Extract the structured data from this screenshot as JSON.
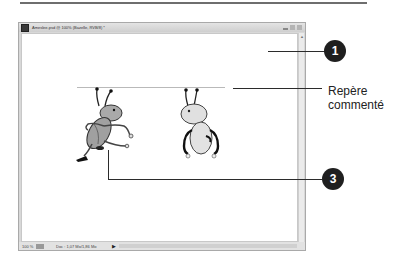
{
  "page": {
    "top_rule": true
  },
  "window": {
    "title": "Ameslee.psd @ 100% (Bazelle, RVB/8) *",
    "controls": [
      "minimize",
      "maximize",
      "close"
    ],
    "status": {
      "zoom": "100 %",
      "info": "Doc : 1,07 Mo/1,86 Mo",
      "arrow": "▶"
    },
    "scroll_arrow": "▲"
  },
  "canvas": {
    "characters": [
      {
        "name": "ant-running",
        "fill": "#a9a9a9"
      },
      {
        "name": "ant-standing",
        "fill": "#e0e0e0"
      }
    ],
    "guide_color": "#b9b9b9"
  },
  "annotations": {
    "callout_1": "1",
    "callout_3": "3",
    "guide_label_line1": "Repère",
    "guide_label_line2": "commenté",
    "callout_color": "#1f1f1f"
  }
}
